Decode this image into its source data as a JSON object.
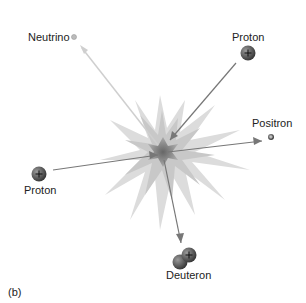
{
  "figure_label": "(b)",
  "particles": {
    "neutrino": {
      "label": "Neutrino",
      "x": 74,
      "y": 37
    },
    "proton_top": {
      "label": "Proton",
      "x": 247,
      "y": 37,
      "charge": "+"
    },
    "proton_left": {
      "label": "Proton",
      "x": 40,
      "y": 176,
      "charge": "+"
    },
    "positron": {
      "label": "Positron",
      "x": 271,
      "y": 123,
      "charge": "+"
    },
    "deuteron": {
      "label": "Deuteron",
      "x": 178,
      "y": 275,
      "charge": "+"
    }
  },
  "colors": {
    "burst": "#d8d8d8",
    "core": "#8a8a8a",
    "arrow": "#777777",
    "neutrino_arrow": "#c8c8c8",
    "particle": "#555555"
  }
}
